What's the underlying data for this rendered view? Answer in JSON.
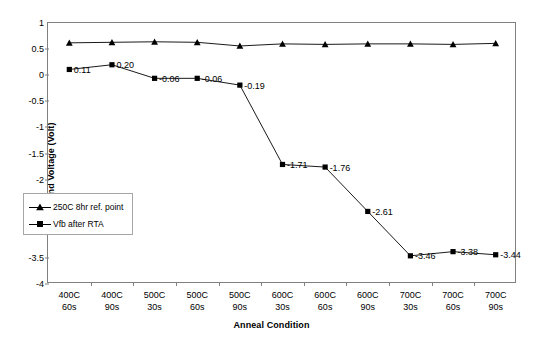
{
  "chart_data": {
    "type": "line",
    "title": "",
    "xlabel": "Anneal Condition",
    "ylabel": "Flatband Voltage (Volt)",
    "ylim": [
      -4,
      1
    ],
    "ytick_labels": [
      "1",
      "0.5",
      "0",
      "-0.5",
      "-1",
      "-1.5",
      "-2",
      "-2.5",
      "-3",
      "-3.5",
      "-4"
    ],
    "ytick_values": [
      1,
      0.5,
      0,
      -0.5,
      -1,
      -1.5,
      -2,
      -2.5,
      -3,
      -3.5,
      -4
    ],
    "grid": false,
    "legend_position": "inside-lower-left",
    "categories": [
      "400C\n60s",
      "400C\n90s",
      "500C\n30s",
      "500C\n60s",
      "500C\n90s",
      "600C\n30s",
      "600C\n60s",
      "600C\n90s",
      "700C\n30s",
      "700C\n60s",
      "700C\n90s"
    ],
    "category_lines": [
      [
        "400C",
        "60s"
      ],
      [
        "400C",
        "90s"
      ],
      [
        "500C",
        "30s"
      ],
      [
        "500C",
        "60s"
      ],
      [
        "500C",
        "90s"
      ],
      [
        "600C",
        "30s"
      ],
      [
        "600C",
        "60s"
      ],
      [
        "600C",
        "90s"
      ],
      [
        "700C",
        "30s"
      ],
      [
        "700C",
        "60s"
      ],
      [
        "700C",
        "90s"
      ]
    ],
    "series": [
      {
        "name": "250C 8hr ref. point",
        "marker": "triangle",
        "color": "#000000",
        "labels_shown": false,
        "values": [
          0.62,
          0.63,
          0.64,
          0.63,
          0.56,
          0.6,
          0.59,
          0.6,
          0.6,
          0.59,
          0.61
        ]
      },
      {
        "name": "Vfb after RTA",
        "marker": "square",
        "color": "#000000",
        "labels_shown": true,
        "values": [
          0.11,
          0.2,
          -0.06,
          -0.06,
          -0.19,
          -1.71,
          -1.76,
          -2.61,
          -3.46,
          -3.38,
          -3.44
        ],
        "value_labels": [
          "0.11",
          "0.20",
          "-0.06",
          "-0.06",
          "-0.19",
          "-1.71",
          "-1.76",
          "-2.61",
          "-3.46",
          "-3.38",
          "-3.44"
        ]
      }
    ]
  },
  "legend": {
    "items": [
      {
        "label": "250C 8hr ref. point",
        "marker": "triangle-icon"
      },
      {
        "label": "Vfb after RTA",
        "marker": "square-icon"
      }
    ]
  }
}
